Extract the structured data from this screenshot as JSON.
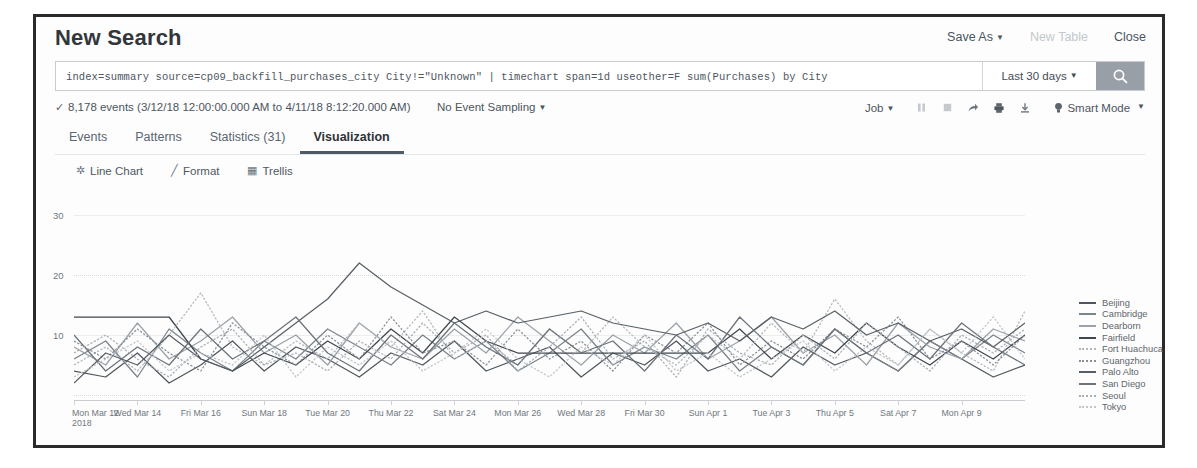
{
  "header": {
    "title": "New Search",
    "actions": [
      {
        "label": "Save As",
        "caret": true,
        "disabled": false,
        "name": "save-as-button"
      },
      {
        "label": "New Table",
        "caret": false,
        "disabled": true,
        "name": "new-table-button"
      },
      {
        "label": "Close",
        "caret": false,
        "disabled": false,
        "name": "close-button"
      }
    ]
  },
  "search": {
    "query": "index=summary source=cp09_backfill_purchases_city City!=\"Unknown\"  |  timechart span=1d useother=F sum(Purchases) by City",
    "time_range": "Last 30 days",
    "search_icon": "search-icon"
  },
  "events": {
    "check": "✓",
    "summary": "8,178 events (3/12/18 12:00:00.000 AM to 4/11/18 8:12:20.000 AM)",
    "sampling": "No Event Sampling",
    "job": "Job",
    "mode": "Smart Mode",
    "icons": [
      "pause-icon",
      "stop-icon",
      "share-icon",
      "print-icon",
      "export-icon"
    ]
  },
  "tabs": [
    {
      "label": "Events",
      "active": false,
      "name": "tab-events"
    },
    {
      "label": "Patterns",
      "active": false,
      "name": "tab-patterns"
    },
    {
      "label": "Statistics (31)",
      "active": false,
      "name": "tab-statistics"
    },
    {
      "label": "Visualization",
      "active": true,
      "name": "tab-visualization"
    }
  ],
  "viz_toolbar": [
    {
      "label": "Line Chart",
      "glyph": "✲",
      "name": "chart-type-button"
    },
    {
      "label": "Format",
      "glyph": "╱",
      "name": "format-button"
    },
    {
      "label": "Trellis",
      "glyph": "▦",
      "name": "trellis-button"
    }
  ],
  "chart_data": {
    "type": "line",
    "title": "",
    "xlabel": "",
    "ylabel": "",
    "ylim": [
      0,
      33
    ],
    "yticks": [
      10,
      20,
      30
    ],
    "ytick_labels": [
      "10",
      "20",
      "30"
    ],
    "grid": true,
    "legend_position": "right",
    "x": [
      "Mon Mar 12",
      "Tue Mar 13",
      "Wed Mar 14",
      "Thu Mar 15",
      "Fri Mar 16",
      "Sat Mar 17",
      "Sun Mar 18",
      "Mon Mar 19",
      "Tue Mar 20",
      "Wed Mar 21",
      "Thu Mar 22",
      "Fri Mar 23",
      "Sat Mar 24",
      "Sun Mar 25",
      "Mon Mar 26",
      "Tue Mar 27",
      "Wed Mar 28",
      "Thu Mar 29",
      "Fri Mar 30",
      "Sat Mar 31",
      "Sun Apr 1",
      "Mon Apr 2",
      "Tue Apr 3",
      "Wed Apr 4",
      "Thu Apr 5",
      "Fri Apr 6",
      "Sat Apr 7",
      "Sun Apr 8",
      "Mon Apr 9",
      "Tue Apr 10",
      "Wed Apr 11"
    ],
    "xtick_labels": [
      "Mon Mar 12",
      "Wed Mar 14",
      "Fri Mar 16",
      "Sun Mar 18",
      "Tue Mar 20",
      "Thu Mar 22",
      "Sat Mar 24",
      "Mon Mar 26",
      "Wed Mar 28",
      "Fri Mar 30",
      "Sun Apr 1",
      "Tue Apr 3",
      "Thu Apr 5",
      "Sat Apr 7",
      "Mon Apr 9"
    ],
    "xtick_indices": [
      0,
      2,
      4,
      6,
      8,
      10,
      12,
      14,
      16,
      18,
      20,
      22,
      24,
      26,
      28
    ],
    "x_year_label": "2018",
    "series": [
      {
        "name": "Beijing",
        "color": "#4f565d",
        "dash": "none",
        "values": [
          4,
          3,
          7,
          2,
          5,
          9,
          4,
          8,
          6,
          3,
          7,
          5,
          9,
          4,
          6,
          8,
          3,
          7,
          5,
          9,
          4,
          6,
          3,
          8,
          5,
          7,
          4,
          9,
          6,
          3,
          5
        ]
      },
      {
        "name": "Cambridge",
        "color": "#7b838b",
        "dash": "none",
        "values": [
          6,
          9,
          3,
          11,
          7,
          4,
          9,
          6,
          11,
          8,
          5,
          10,
          6,
          9,
          4,
          7,
          11,
          5,
          8,
          6,
          10,
          4,
          8,
          5,
          11,
          7,
          4,
          9,
          6,
          10,
          7
        ]
      },
      {
        "name": "Dearborn",
        "color": "#9aa1a8",
        "dash": "none",
        "values": [
          8,
          5,
          12,
          6,
          9,
          13,
          7,
          10,
          5,
          12,
          8,
          6,
          11,
          7,
          13,
          9,
          5,
          10,
          7,
          12,
          6,
          9,
          13,
          7,
          10,
          5,
          12,
          8,
          6,
          11,
          9
        ]
      },
      {
        "name": "Fairfield",
        "color": "#3f464d",
        "dash": "none",
        "values": [
          13,
          13,
          13,
          13,
          6,
          4,
          7,
          5,
          9,
          6,
          11,
          7,
          13,
          9,
          7,
          7,
          7,
          7,
          7,
          7,
          7,
          11,
          6,
          10,
          7,
          12,
          8,
          5,
          9,
          6,
          10
        ]
      },
      {
        "name": "Fort Huachuca",
        "color": "#b2b8bd",
        "dash": "dotted",
        "values": [
          5,
          8,
          4,
          10,
          17,
          8,
          5,
          9,
          6,
          12,
          8,
          14,
          6,
          9,
          5,
          11,
          7,
          13,
          8,
          5,
          10,
          6,
          12,
          7,
          16,
          9,
          5,
          11,
          7,
          4,
          14
        ]
      },
      {
        "name": "Guangzhou",
        "color": "#888f96",
        "dash": "dotted",
        "values": [
          9,
          6,
          11,
          7,
          4,
          12,
          8,
          5,
          10,
          6,
          13,
          7,
          9,
          5,
          11,
          6,
          9,
          4,
          10,
          7,
          12,
          5,
          9,
          6,
          11,
          8,
          13,
          6,
          9,
          5,
          10
        ]
      },
      {
        "name": "Palo Alto",
        "color": "#585f66",
        "dash": "none",
        "values": [
          2,
          7,
          5,
          10,
          6,
          4,
          8,
          12,
          16,
          22,
          18,
          15,
          12,
          14,
          12,
          13,
          14,
          12,
          11,
          10,
          12,
          9,
          13,
          11,
          14,
          10,
          12,
          9,
          11,
          8,
          12
        ]
      },
      {
        "name": "San Diego",
        "color": "#6b727a",
        "dash": "none",
        "values": [
          10,
          4,
          8,
          5,
          11,
          6,
          9,
          13,
          7,
          4,
          10,
          6,
          12,
          8,
          5,
          11,
          7,
          9,
          4,
          10,
          6,
          13,
          8,
          5,
          11,
          7,
          10,
          6,
          12,
          8,
          5
        ]
      },
      {
        "name": "Seoul",
        "color": "#a8aeb4",
        "dash": "dotted",
        "values": [
          7,
          10,
          6,
          3,
          8,
          11,
          5,
          7,
          4,
          9,
          6,
          12,
          7,
          10,
          4,
          8,
          13,
          6,
          9,
          3,
          11,
          7,
          5,
          10,
          6,
          12,
          8,
          4,
          10,
          7,
          11
        ]
      },
      {
        "name": "Tokyo",
        "color": "#c0c5ca",
        "dash": "dotted",
        "values": [
          3,
          6,
          9,
          4,
          7,
          5,
          10,
          3,
          8,
          5,
          9,
          4,
          7,
          11,
          6,
          3,
          8,
          5,
          10,
          4,
          7,
          3,
          6,
          9,
          4,
          8,
          5,
          11,
          7,
          13,
          6
        ]
      }
    ]
  }
}
